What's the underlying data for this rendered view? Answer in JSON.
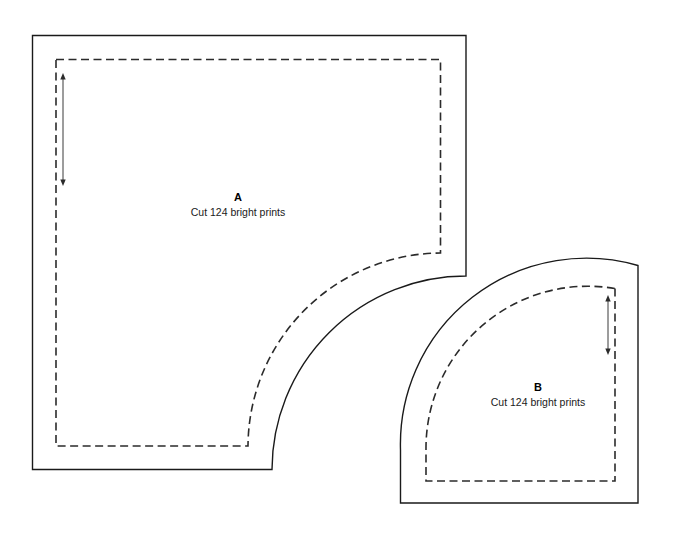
{
  "page": {
    "background_color": "#ffffff",
    "width": 675,
    "height": 536
  },
  "style": {
    "cut_line_color": "#1a1a1a",
    "sew_line_color": "#2b2b2b",
    "grain_line_color": "#3a3a3a",
    "sew_line_dash": "8 4.5"
  },
  "pieces": [
    {
      "id": "A",
      "letter": "A",
      "note": "Cut 124 bright prints",
      "shape": "square-with-concave-corner",
      "label_x": 238,
      "letter_y": 201,
      "note_y": 216,
      "cut_path": "M 32.5 35.5 L 466 35.5 L 466 276 A 194 194 0 0 0 272 469.5 L 32.5 469.5 Z",
      "sew_path": "M 56 59.5 L 440.5 59.5 L 440.5 253 A 194 194 0 0 0 248 446 L 56 446 Z",
      "grain": {
        "x": 63,
        "y_top": 73,
        "y_bottom": 186
      }
    },
    {
      "id": "B",
      "letter": "B",
      "note": "Cut 124 bright prints",
      "shape": "quarter-circle",
      "label_x": 538,
      "letter_y": 391,
      "note_y": 406,
      "cut_path": "M 638 265.5 L 638 503 L 400.5 503 L 400.5 450 A 186 186 0 0 1 638 265.5 Z",
      "sew_path": "M 615 288.5 L 615 481 L 426 481 L 426 450 A 162 162 0 0 1 615 288.5 Z",
      "grain": {
        "x": 608,
        "y_top": 295,
        "y_bottom": 355
      }
    }
  ]
}
